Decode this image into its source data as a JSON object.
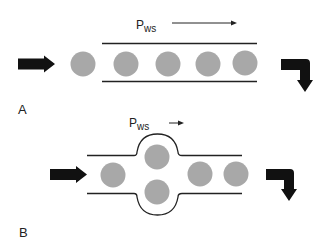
{
  "colors": {
    "background": "#ffffff",
    "particle": "#a8a8a8",
    "wall": "#222222",
    "arrow": "#111111"
  },
  "panels": [
    {
      "id": "A",
      "label": "A",
      "pressure_label_main": "P",
      "pressure_label_sub": "ws",
      "flow_arrow": "long",
      "description": "Straight vessel with particles in single file"
    },
    {
      "id": "B",
      "label": "B",
      "pressure_label_main": "P",
      "pressure_label_sub": "ws",
      "flow_arrow": "short",
      "description": "Vessel with bulge; particles spread into bulge"
    }
  ]
}
